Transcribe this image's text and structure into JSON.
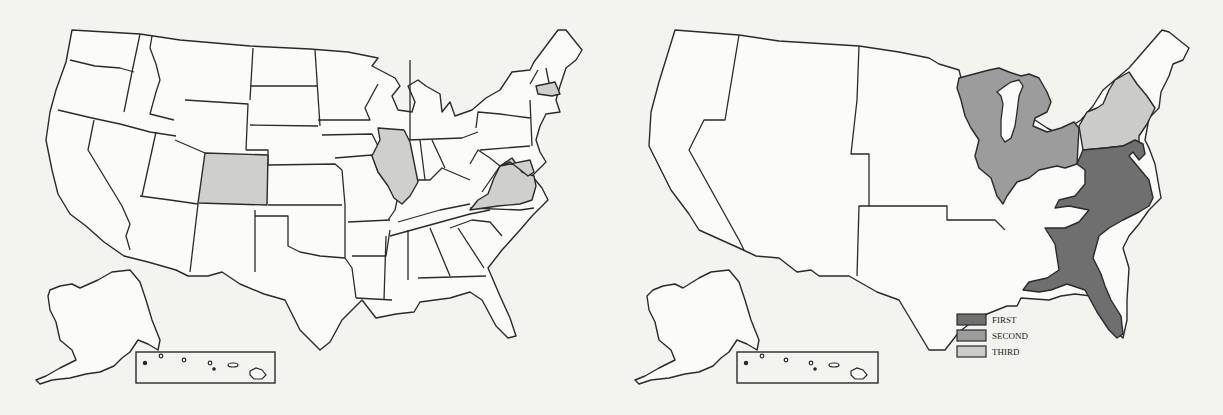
{
  "figure": {
    "left_map": {
      "description": "United States state map with selected states shaded",
      "shaded_states": [
        "Colorado",
        "Illinois",
        "Virginia",
        "Maryland",
        "Massachusetts"
      ],
      "shade_color": "#cfcfcd",
      "inset": "Hawaii islands in rectangular inset; Alaska at lower left"
    },
    "right_map": {
      "description": "United States regional map with three shaded regions",
      "legend": [
        {
          "label": "FIRST",
          "color": "#6f6f6f"
        },
        {
          "label": "SECOND",
          "color": "#9c9c9c"
        },
        {
          "label": "THIRD",
          "color": "#cbcbc9"
        }
      ],
      "regions": {
        "FIRST": "Southeast (Atlantic coast Delaware through Florida, Gulf coast to Mississippi)",
        "SECOND": "Great Lakes / Old Northwest",
        "THIRD": "Mid-Atlantic (New York / Pennsylvania area)"
      }
    }
  }
}
